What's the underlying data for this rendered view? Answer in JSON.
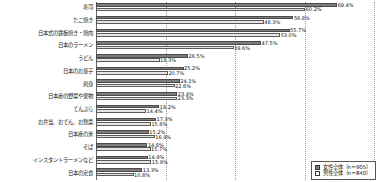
{
  "chart_data": {
    "type": "bar",
    "title": "",
    "subtitle": "",
    "xlabel": "",
    "ylabel": "",
    "orientation": "horizontal",
    "grid": true,
    "gridlines": [
      0,
      20,
      40,
      60,
      80
    ],
    "xlim": [
      0,
      80
    ],
    "legend_position": "bottom-right",
    "categories": [
      "寿司",
      "たこ焼き",
      "日本式の鉄板焼き・焼肉",
      "日本のラーメン",
      "うどん",
      "日本のお菓子",
      "刺身",
      "日本産の野菜や果物",
      "てんぷら",
      "お弁当、おでん、お惣菜",
      "日本産の米",
      "そば",
      "インスタントラーメンなど",
      "日本の定食"
    ],
    "series": [
      {
        "name": "女性全体（n＝905）",
        "color": "#7c7c7c",
        "values": [
          69.4,
          56.8,
          55.7,
          47.5,
          26.5,
          25.2,
          24.1,
          23.4,
          18.2,
          17.3,
          15.2,
          14.8,
          14.9,
          13.3
        ]
      },
      {
        "name": "男性全体（n＝840）",
        "color": "#e6e6e6",
        "values": [
          60.2,
          48.3,
          53.0,
          39.6,
          18.3,
          20.7,
          22.6,
          23.3,
          14.4,
          15.8,
          16.9,
          15.7,
          15.9,
          10.8
        ]
      }
    ],
    "value_labels": {
      "female": [
        "69.4%",
        "56.8%",
        "55.7%",
        "47.5%",
        "26.5%",
        "25.2%",
        "24.1%",
        "23.4%",
        "18.2%",
        "17.3%",
        "15.2%",
        "14.8%",
        "14.9%",
        "13.3%"
      ],
      "male": [
        "60.2%",
        "48.3%",
        "53.0%",
        "39.6%",
        "18.3%",
        "20.7%",
        "22.6%",
        "23.3%",
        "14.4%",
        "15.8%",
        "16.9%",
        "15.7%",
        "15.9%",
        "10.8%"
      ]
    }
  },
  "legend": {
    "items": [
      {
        "label": "女性全体（n＝905）",
        "swatch": "female"
      },
      {
        "label": "男性全体（n＝840）",
        "swatch": "male"
      }
    ]
  }
}
